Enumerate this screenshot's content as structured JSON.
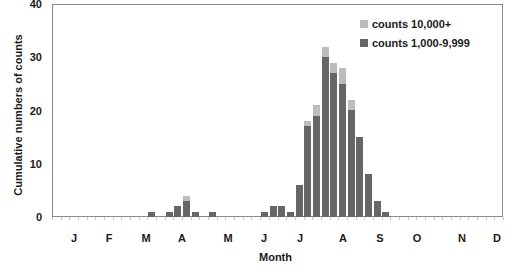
{
  "chart_data": {
    "type": "bar",
    "stacked": true,
    "title": "",
    "xlabel": "Month",
    "ylabel": "Cumulative numbers of counts",
    "ylim": [
      0,
      40
    ],
    "yticks": [
      "0",
      "10",
      "20",
      "30",
      "40"
    ],
    "month_labels": [
      "J",
      "F",
      "M",
      "A",
      "M",
      "J",
      "J",
      "A",
      "S",
      "O",
      "N",
      "D"
    ],
    "x_unit": "week of year (0-51)",
    "weeks": [
      11,
      13,
      14,
      15,
      16,
      18,
      24,
      25,
      26,
      27,
      28,
      29,
      30,
      31,
      32,
      33,
      34,
      35,
      36,
      37,
      38
    ],
    "series": [
      {
        "name": "counts 1,000-9,999",
        "color": "#666666",
        "values": [
          1,
          1,
          2,
          3,
          1,
          1,
          1,
          2,
          2,
          1,
          6,
          17,
          19,
          30,
          27,
          25,
          20,
          15,
          8,
          3,
          1
        ]
      },
      {
        "name": "counts 10,000+",
        "color": "#bcbcbc",
        "values": [
          0,
          0,
          0,
          1,
          0,
          0,
          0,
          0,
          0,
          0,
          0,
          1,
          2,
          2,
          2,
          3,
          2,
          0,
          0,
          0,
          0
        ]
      }
    ],
    "legend_position": "top-right",
    "grid": false
  },
  "legend": {
    "items": [
      {
        "label": "counts 10,000+",
        "color": "#bcbcbc"
      },
      {
        "label": "counts 1,000-9,999",
        "color": "#666666"
      }
    ]
  }
}
